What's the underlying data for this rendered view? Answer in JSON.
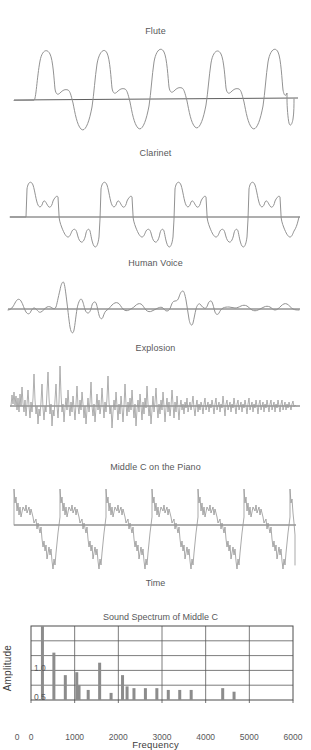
{
  "figure": {
    "time_axis_label": "Time"
  },
  "panels": [
    {
      "id": "flute",
      "title": "Flute"
    },
    {
      "id": "clarinet",
      "title": "Clarinet"
    },
    {
      "id": "human-voice",
      "title": "Human Voice"
    },
    {
      "id": "explosion",
      "title": "Explosion"
    },
    {
      "id": "piano",
      "title": "Middle C on the Piano"
    }
  ],
  "colors": {
    "trace": "#8c8c8c",
    "axis": "#4d4d4d",
    "grid": "#5a5a5a",
    "bar": "#8c8c8c",
    "text": "#58585a"
  },
  "chart_data": {
    "type": "bar",
    "title": "Sound Spectrum of Middle C",
    "xlabel": "Frequency",
    "ylabel": "Amplitude",
    "xlim": [
      0,
      6000
    ],
    "ylim": [
      0,
      1.25
    ],
    "grid": true,
    "legend": "none",
    "xticks": [
      0,
      1000,
      2000,
      3000,
      4000,
      5000,
      6000
    ],
    "xtick_labels": [
      "0",
      "1000",
      "2000",
      "3000",
      "4000",
      "5000",
      "6000"
    ],
    "extra_xtick_label": "0",
    "yticks": [
      0.5,
      1.0
    ],
    "ytick_labels": [
      "0.5",
      "1.0"
    ],
    "ygridlines": [
      0.25,
      0.5,
      0.75,
      1.0
    ],
    "xgridlines": [
      1000,
      2000,
      3000,
      4000,
      5000
    ],
    "x": [
      262,
      524,
      786,
      1048,
      1100,
      1310,
      1572,
      1834,
      2096,
      2200,
      2358,
      2620,
      2882,
      3144,
      3406,
      3668,
      4390,
      4650
    ],
    "values": [
      1.25,
      0.8,
      0.42,
      0.47,
      0.25,
      0.17,
      0.63,
      0.12,
      0.42,
      0.23,
      0.2,
      0.2,
      0.2,
      0.17,
      0.17,
      0.17,
      0.2,
      0.14
    ],
    "categories": [
      "262",
      "524",
      "786",
      "1048",
      "1100",
      "1310",
      "1572",
      "1834",
      "2096",
      "2200",
      "2358",
      "2620",
      "2882",
      "3144",
      "3406",
      "3668",
      "4390",
      "4650"
    ]
  }
}
